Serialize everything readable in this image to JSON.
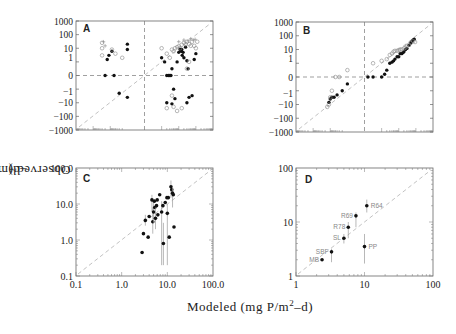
{
  "figure": {
    "shared_ylabel": "Observed (mg P/m",
    "shared_ylabel_sup": "2",
    "shared_ylabel_tail": "–d)",
    "shared_xlabel": "Modeled (mg P/m",
    "shared_xlabel_sup": "2",
    "shared_xlabel_tail": "–d)"
  },
  "chart_data": [
    {
      "panel": "A",
      "type": "scatter",
      "title": "",
      "xlabel": "Modeled (mg P/m2-d)",
      "ylabel": "Observed (mg P/m2-d)",
      "yscale": "symlog",
      "ytick_labels": [
        "1000",
        "100",
        "10",
        "1",
        "0",
        "-1",
        "-10",
        "-100",
        "-1000"
      ],
      "xtick_labels": [],
      "reference_lines": [
        "1:1 dashed diagonal",
        "horizontal dashed at y=0",
        "vertical dashed at x=0"
      ],
      "series": [
        {
          "name": "filled circles",
          "marker": "filled",
          "points": [
            [
              -8,
              6
            ],
            [
              -12,
              3
            ],
            [
              -15,
              1.5
            ],
            [
              -20,
              0
            ],
            [
              -6,
              0
            ],
            [
              -3,
              -2
            ],
            [
              -1,
              -4
            ],
            [
              -1,
              20
            ],
            [
              -1,
              8
            ],
            [
              1,
              2
            ],
            [
              1.5,
              1
            ],
            [
              2,
              0
            ],
            [
              2.5,
              0
            ],
            [
              3,
              0
            ],
            [
              3.5,
              0
            ],
            [
              4,
              0.5
            ],
            [
              5,
              -1
            ],
            [
              6,
              -5
            ],
            [
              8,
              1
            ],
            [
              10,
              5
            ],
            [
              12,
              8
            ],
            [
              14,
              6
            ],
            [
              15,
              8
            ],
            [
              16,
              3
            ],
            [
              18,
              5
            ],
            [
              20,
              2
            ],
            [
              25,
              12
            ],
            [
              30,
              1.2
            ],
            [
              35,
              0.5
            ],
            [
              40,
              -4
            ],
            [
              60,
              -3
            ],
            [
              80,
              1.5
            ],
            [
              100,
              4
            ],
            [
              4,
              -12
            ],
            [
              2,
              -10
            ],
            [
              30,
              -10
            ]
          ]
        },
        {
          "name": "open circles",
          "marker": "open",
          "points": [
            [
              -30,
              25
            ],
            [
              -30,
              10
            ],
            [
              -30,
              3
            ],
            [
              -8,
              8
            ],
            [
              -5,
              4
            ],
            [
              -2,
              2
            ],
            [
              1,
              10
            ],
            [
              2,
              4
            ],
            [
              3,
              2
            ],
            [
              4,
              8
            ],
            [
              5,
              6
            ],
            [
              6,
              10
            ],
            [
              8,
              12
            ],
            [
              10,
              14
            ],
            [
              12,
              10
            ],
            [
              15,
              18
            ],
            [
              20,
              25
            ],
            [
              25,
              20
            ],
            [
              30,
              30
            ],
            [
              40,
              20
            ],
            [
              50,
              15
            ],
            [
              60,
              30
            ],
            [
              80,
              15
            ],
            [
              100,
              10
            ],
            [
              120,
              30
            ],
            [
              5,
              -20
            ],
            [
              8,
              -40
            ],
            [
              15,
              -25
            ],
            [
              30,
              0.5
            ],
            [
              40,
              1
            ],
            [
              2,
              -25
            ],
            [
              4,
              -3
            ]
          ]
        },
        {
          "name": "plus",
          "marker": "+",
          "points": [
            [
              -25,
              30
            ],
            [
              -20,
              15
            ],
            [
              10,
              30
            ],
            [
              20,
              40
            ],
            [
              35,
              35
            ],
            [
              50,
              50
            ],
            [
              70,
              40
            ],
            [
              90,
              45
            ]
          ]
        }
      ]
    },
    {
      "panel": "B",
      "type": "scatter",
      "xlabel": "Modeled (mg P/m2-d)",
      "ylabel": "Observed (mg P/m2-d)",
      "yscale": "symlog",
      "ytick_labels": [
        "1000",
        "100",
        "10",
        "1",
        "0",
        "-1",
        "-10",
        "-100",
        "-1000"
      ],
      "xtick_labels": [],
      "reference_lines": [
        "1:1 dashed diagonal",
        "horizontal dashed at y=0",
        "vertical dashed at x=0"
      ],
      "series": [
        {
          "name": "filled circles",
          "marker": "filled",
          "points": [
            [
              -12,
              -7
            ],
            [
              -10,
              -4
            ],
            [
              -8,
              -3
            ],
            [
              -6,
              -3
            ],
            [
              -4,
              -2
            ],
            [
              -2,
              -1
            ],
            [
              -1,
              -0.5
            ],
            [
              0.2,
              0
            ],
            [
              0.5,
              0
            ],
            [
              1,
              0
            ],
            [
              1.5,
              0.2
            ],
            [
              2,
              0.5
            ],
            [
              3,
              1
            ],
            [
              4,
              1.2
            ],
            [
              5,
              1.5
            ],
            [
              6,
              2
            ],
            [
              8,
              3
            ],
            [
              10,
              3
            ],
            [
              12,
              5
            ],
            [
              15,
              5
            ],
            [
              18,
              6
            ],
            [
              20,
              7
            ],
            [
              25,
              10
            ],
            [
              30,
              12
            ],
            [
              40,
              20
            ],
            [
              50,
              30
            ],
            [
              60,
              40
            ],
            [
              70,
              50
            ],
            [
              80,
              55
            ]
          ]
        },
        {
          "name": "open circles",
          "marker": "open",
          "points": [
            [
              -15,
              -15
            ],
            [
              -12,
              -10
            ],
            [
              -10,
              -3
            ],
            [
              -8,
              -1
            ],
            [
              -5,
              0
            ],
            [
              -3,
              0
            ],
            [
              -1,
              0.5
            ],
            [
              0.5,
              1
            ],
            [
              1,
              1.5
            ],
            [
              2,
              2
            ],
            [
              3,
              4
            ],
            [
              4,
              5
            ],
            [
              5,
              7
            ],
            [
              6,
              8
            ],
            [
              8,
              8
            ],
            [
              10,
              9
            ],
            [
              12,
              10
            ],
            [
              15,
              10
            ],
            [
              20,
              12
            ],
            [
              25,
              14
            ],
            [
              30,
              18
            ],
            [
              40,
              22
            ],
            [
              50,
              30
            ],
            [
              70,
              40
            ],
            [
              90,
              35
            ]
          ]
        }
      ]
    },
    {
      "panel": "C",
      "type": "scatter",
      "xscale": "log",
      "yscale": "log",
      "xlim": [
        0.1,
        100
      ],
      "ylim": [
        0.1,
        100
      ],
      "xtick_labels": [
        "0.1",
        "1.0",
        "10.0",
        "100.0"
      ],
      "ytick_labels": [
        "100.0",
        "10.0",
        "1.0",
        "0.1"
      ],
      "reference_lines": [
        "1:1 dashed diagonal"
      ],
      "error_bars": true,
      "points": [
        {
          "x": 2.8,
          "y": 0.45
        },
        {
          "x": 3.0,
          "y": 1.5
        },
        {
          "x": 3.3,
          "y": 3.5,
          "ylo": 2.5,
          "yhi": 5
        },
        {
          "x": 3.8,
          "y": 1.2
        },
        {
          "x": 4.0,
          "y": 4.5
        },
        {
          "x": 4.6,
          "y": 13,
          "ylo": 6,
          "yhi": 18
        },
        {
          "x": 4.8,
          "y": 3.2,
          "ylo": 1.5,
          "yhi": 8
        },
        {
          "x": 5.0,
          "y": 6,
          "ylo": 3,
          "yhi": 12
        },
        {
          "x": 5.2,
          "y": 12
        },
        {
          "x": 5.3,
          "y": 8
        },
        {
          "x": 5.5,
          "y": 4,
          "ylo": 2,
          "yhi": 8
        },
        {
          "x": 5.8,
          "y": 9
        },
        {
          "x": 6.0,
          "y": 13
        },
        {
          "x": 6.2,
          "y": 5
        },
        {
          "x": 6.8,
          "y": 18
        },
        {
          "x": 7.5,
          "y": 6,
          "ylo": 0.2,
          "yhi": 12
        },
        {
          "x": 8.0,
          "y": 9
        },
        {
          "x": 8.2,
          "y": 0.8,
          "ylo": 0.2,
          "yhi": 3
        },
        {
          "x": 9.0,
          "y": 11
        },
        {
          "x": 9.8,
          "y": 15
        },
        {
          "x": 10.0,
          "y": 5.5,
          "ylo": 0.2,
          "yhi": 10
        },
        {
          "x": 10.5,
          "y": 15
        },
        {
          "x": 11.0,
          "y": 1.2
        },
        {
          "x": 12.0,
          "y": 30,
          "ylo": 15,
          "yhi": 45
        },
        {
          "x": 12.5,
          "y": 25
        },
        {
          "x": 13.0,
          "y": 20,
          "ylo": 8,
          "yhi": 30
        },
        {
          "x": 13.5,
          "y": 18
        },
        {
          "x": 14.0,
          "y": 2.3
        }
      ]
    },
    {
      "panel": "D",
      "type": "scatter",
      "xscale": "log",
      "yscale": "log",
      "xlim": [
        1,
        100
      ],
      "ylim": [
        1,
        100
      ],
      "xtick_labels": [
        "1",
        "10",
        "100"
      ],
      "ytick_labels": [
        "100",
        "10",
        "1"
      ],
      "reference_lines": [
        "1:1 dashed diagonal"
      ],
      "error_bars": true,
      "points": [
        {
          "label": "MB",
          "x": 2.4,
          "y": 2.0
        },
        {
          "label": "SBF",
          "x": 3.3,
          "y": 2.8,
          "ylo": 1.8,
          "yhi": 3.2
        },
        {
          "label": "SL",
          "x": 5.0,
          "y": 5.0,
          "ylo": 4.0,
          "yhi": 6.0
        },
        {
          "label": "R78",
          "x": 5.8,
          "y": 8.0,
          "ylo": 5.0,
          "yhi": 10.0
        },
        {
          "label": "R69",
          "x": 7.5,
          "y": 13.0,
          "ylo": 8.0,
          "yhi": 15.0
        },
        {
          "label": "R64",
          "x": 10.8,
          "y": 20.0,
          "ylo": 15.0,
          "yhi": 26.0
        },
        {
          "label": "PP",
          "x": 10.0,
          "y": 3.5,
          "ylo": 1.7,
          "yhi": 6.0
        }
      ]
    }
  ],
  "panels": {
    "A": {
      "letter": "A",
      "y_ticks": [
        "1000",
        "100",
        "10",
        "1",
        "0",
        "−1",
        "−10",
        "−100",
        "−1000"
      ]
    },
    "B": {
      "letter": "B",
      "y_ticks": [
        "1000",
        "100",
        "10",
        "1",
        "0",
        "−1",
        "−10",
        "−100",
        "−1000"
      ]
    },
    "C": {
      "letter": "C",
      "y_ticks": [
        "100.0",
        "10.0",
        "1.0",
        "0.1"
      ],
      "x_ticks": [
        "0.1",
        "1.0",
        "10.0",
        "100.0"
      ]
    },
    "D": {
      "letter": "D",
      "y_ticks": [
        "100",
        "10",
        "1"
      ],
      "x_ticks": [
        "1",
        "10",
        "100"
      ],
      "labels": [
        "MB",
        "SBF",
        "SL",
        "R78",
        "R69",
        "R64",
        "PP"
      ]
    }
  }
}
